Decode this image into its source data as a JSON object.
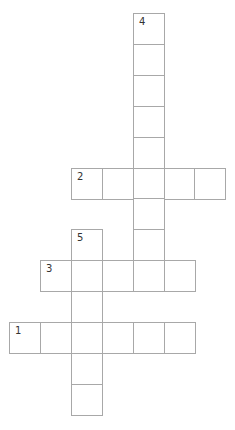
{
  "puzzle": {
    "type": "crossword",
    "rows": 13,
    "cols": 7,
    "words": [
      {
        "number": "1",
        "direction": "across",
        "row": 10,
        "col": 0,
        "length": 6
      },
      {
        "number": "2",
        "direction": "across",
        "row": 5,
        "col": 2,
        "length": 5
      },
      {
        "number": "3",
        "direction": "across",
        "row": 8,
        "col": 1,
        "length": 5
      },
      {
        "number": "4",
        "direction": "down",
        "row": 0,
        "col": 4,
        "length": 9
      },
      {
        "number": "5",
        "direction": "down",
        "row": 7,
        "col": 2,
        "length": 6
      }
    ]
  },
  "colors": {
    "border": "#a8a8a8",
    "number": "#333333",
    "background": "#ffffff"
  }
}
